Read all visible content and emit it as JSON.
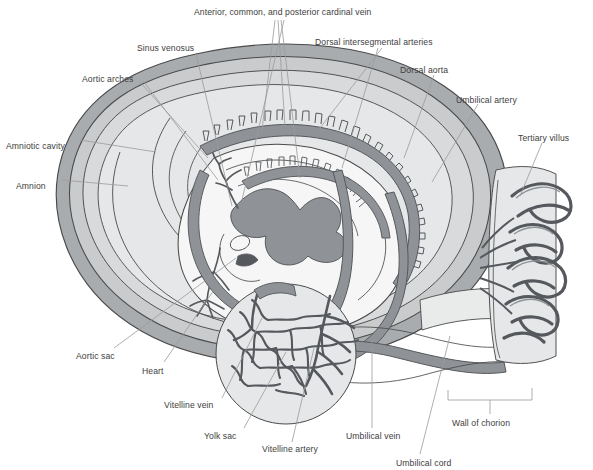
{
  "figure": {
    "kind": "anatomical-diagram",
    "palette": {
      "outline": "#4a4a4a",
      "vessel_fill": "#8f9296",
      "vessel_outline": "#55585c",
      "amnion_band": "#9b9ea1",
      "chorion_band": "#a7aaad",
      "cavity_fill": "#d5d6d7",
      "embryo_fill": "#f4f4f4",
      "yolk_fill": "#e4e5e6",
      "leader_line": "#9a9a9a",
      "label_text": "#3d3d3d",
      "background": "#ffffff"
    }
  },
  "labels": [
    {
      "id": "anterior-common-posterior-cardinal-vein",
      "text": "Anterior, common, and posterior cardinal vein",
      "x": 194,
      "y": 8
    },
    {
      "id": "sinus-venosus",
      "text": "Sinus venosus",
      "x": 137,
      "y": 44
    },
    {
      "id": "dorsal-intersegmental-arteries",
      "text": "Dorsal intersegmental arteries",
      "x": 315,
      "y": 38
    },
    {
      "id": "aortic-arches",
      "text": "Aortic arches",
      "x": 82,
      "y": 75
    },
    {
      "id": "dorsal-aorta",
      "text": "Dorsal aorta",
      "x": 400,
      "y": 66
    },
    {
      "id": "umbilical-artery",
      "text": "Umbilical artery",
      "x": 456,
      "y": 96
    },
    {
      "id": "tertiary-villus",
      "text": "Tertiary villus",
      "x": 518,
      "y": 134
    },
    {
      "id": "amniotic-cavity",
      "text": "Amniotic cavity",
      "x": 6,
      "y": 142
    },
    {
      "id": "amnion",
      "text": "Amnion",
      "x": 16,
      "y": 182
    },
    {
      "id": "aortic-sac",
      "text": "Aortic sac",
      "x": 76,
      "y": 352
    },
    {
      "id": "heart",
      "text": "Heart",
      "x": 142,
      "y": 367
    },
    {
      "id": "vitelline-vein",
      "text": "Vitelline vein",
      "x": 164,
      "y": 401
    },
    {
      "id": "yolk-sac",
      "text": "Yolk sac",
      "x": 204,
      "y": 432
    },
    {
      "id": "vitelline-artery",
      "text": "Vitelline artery",
      "x": 262,
      "y": 445
    },
    {
      "id": "umbilical-vein",
      "text": "Umbilical vein",
      "x": 346,
      "y": 432
    },
    {
      "id": "umbilical-cord",
      "text": "Umbilical cord",
      "x": 396,
      "y": 459
    },
    {
      "id": "wall-of-chorion",
      "text": "Wall of chorion",
      "x": 452,
      "y": 419
    }
  ]
}
